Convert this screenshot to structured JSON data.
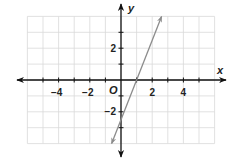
{
  "chart_data": {
    "type": "line",
    "title": "",
    "xlabel": "x",
    "ylabel": "y",
    "origin_label": "O",
    "xlim": [
      -6,
      6
    ],
    "ylim": [
      -4,
      4
    ],
    "grid": true,
    "grid_step": 1,
    "x_tick_labels": [
      {
        "value": -4,
        "label": "−4"
      },
      {
        "value": -2,
        "label": "−2"
      },
      {
        "value": 2,
        "label": "2"
      },
      {
        "value": 4,
        "label": "4"
      }
    ],
    "y_tick_labels": [
      {
        "value": 2,
        "label": "2"
      },
      {
        "value": -2,
        "label": "−2"
      }
    ],
    "series": [
      {
        "name": "line",
        "equation": "y = 2.5x − 2.5",
        "slope": 2.5,
        "intercept": -2.5,
        "x_intercept": 1,
        "endpoints": [
          [
            -0.6,
            -4
          ],
          [
            2.6,
            4
          ]
        ],
        "arrows_both_ends": true,
        "color": "#8c8c8c"
      }
    ],
    "colors": {
      "axis": "#111111",
      "grid": "#d9d9d9",
      "line": "#8c8c8c"
    }
  }
}
